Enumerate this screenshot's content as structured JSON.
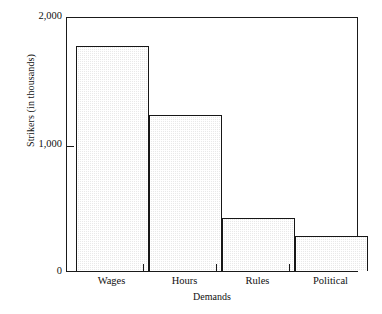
{
  "chart_data": {
    "type": "bar",
    "title": "",
    "subtitle": "",
    "xlabel": "Demands",
    "ylabel": "Strikers (in thousands)",
    "categories": [
      "Wages",
      "Hours",
      "Rules",
      "Political"
    ],
    "values": [
      1765,
      1225,
      415,
      275
    ],
    "ylim": [
      0,
      2000
    ],
    "y_ticks": [
      0,
      1000,
      2000
    ],
    "y_tick_labels": [
      "0",
      "1,000",
      "2,000"
    ],
    "grid": false,
    "legend": null,
    "legend_position": "none",
    "annotations": [],
    "bar_fill_color": "#e9e9e9",
    "bar_edge_color": "#171717",
    "axis_color": "#1a1a1a",
    "background_color": "#ffffff"
  },
  "axes": {
    "y_title": "Strikers (in thousands)",
    "x_title": "Demands",
    "y_tick_labels": [
      "2,000",
      "1,000",
      "0"
    ],
    "x_tick_labels": [
      "Wages",
      "Hours",
      "Rules",
      "Political"
    ]
  }
}
